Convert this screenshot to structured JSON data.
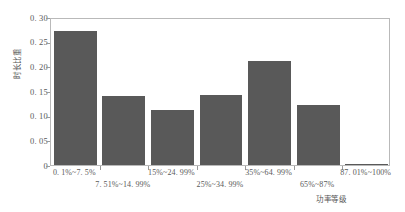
{
  "chart_data": {
    "type": "bar",
    "title": "",
    "xlabel": "功率等级",
    "ylabel": "时长比重",
    "categories": [
      "0. 1%~7. 5%",
      "7. 51%~14. 99%",
      "15%~24. 99%",
      "25%~34. 99%",
      "35%~64. 99%",
      "65%~87%",
      "87. 01%~100%"
    ],
    "values": [
      0.272,
      0.14,
      0.111,
      0.142,
      0.211,
      0.121,
      0.003
    ],
    "ylim": [
      0,
      0.3
    ],
    "yticks": [
      0,
      0.05,
      0.1,
      0.15,
      0.2,
      0.25,
      0.3
    ],
    "ytick_labels": [
      "0",
      "0. 05",
      "0. 10",
      "0. 15",
      "0. 20",
      "0. 25",
      "0. 30"
    ],
    "grid": false,
    "legend": null,
    "bar_color": "#595959",
    "axis_color": "#b9b9b9",
    "text_color": "#5a5a5a"
  }
}
